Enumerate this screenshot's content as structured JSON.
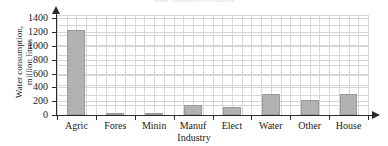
{
  "chart_data": {
    "type": "bar",
    "title": "Water consumption by industry",
    "xlabel": "Industry",
    "ylabel_line1": "Water consumption,",
    "ylabel_line2": "million litres",
    "categories": [
      "Agric",
      "Fores",
      "Minin",
      "Manuf",
      "Elect",
      "Water",
      "Other",
      "House"
    ],
    "values": [
      1230,
      25,
      20,
      145,
      115,
      310,
      220,
      310
    ],
    "yticks": [
      "0",
      "200",
      "400",
      "600",
      "800",
      "1000",
      "1200",
      "1400"
    ],
    "ytick_values": [
      0,
      200,
      400,
      600,
      800,
      1000,
      1200,
      1400
    ],
    "ylim": [
      0,
      1450
    ],
    "grid": true,
    "legend": "none",
    "bar_color": "#b2b2b2",
    "bar_edge_color": "#9a9a9a",
    "grid_color": "#d6d6da",
    "axis_color": "#2b2b2b",
    "background": "#ffffff"
  }
}
